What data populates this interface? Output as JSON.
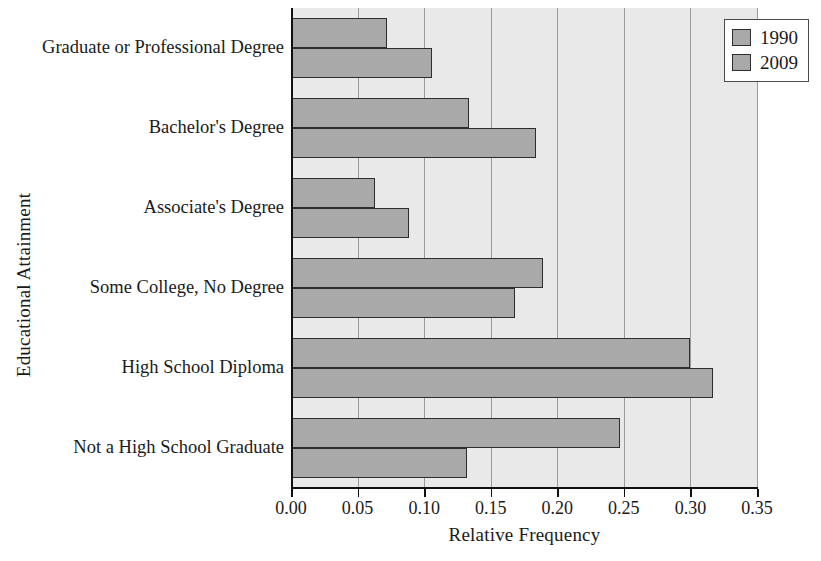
{
  "chart_data": {
    "type": "bar",
    "orientation": "horizontal",
    "title": "",
    "xlabel": "Relative Frequency",
    "ylabel": "Educational Attainment",
    "xlim": [
      0.0,
      0.35
    ],
    "xticks": [
      "0.00",
      "0.05",
      "0.10",
      "0.15",
      "0.20",
      "0.25",
      "0.30",
      "0.35"
    ],
    "xtick_values": [
      0.0,
      0.05,
      0.1,
      0.15,
      0.2,
      0.25,
      0.3,
      0.35
    ],
    "grid": "vertical",
    "legend_position": "top-right",
    "categories": [
      "Graduate or Professional Degree",
      "Bachelor's Degree",
      "Associate's Degree",
      "Some College, No Degree",
      "High School Diploma",
      "Not a High School Graduate"
    ],
    "series": [
      {
        "name": "1990",
        "color": "#a9a9a9",
        "values": [
          0.072,
          0.134,
          0.063,
          0.189,
          0.3,
          0.247
        ]
      },
      {
        "name": "2009",
        "color": "#a9a9a9",
        "values": [
          0.106,
          0.184,
          0.089,
          0.168,
          0.317,
          0.132
        ]
      }
    ]
  },
  "legend": {
    "entries": [
      {
        "label": "1990"
      },
      {
        "label": "2009"
      }
    ]
  },
  "colors": {
    "bar_fill": "#a9a9a9",
    "bar_edge": "#2d2d2d",
    "plot_background": "#e9e9e9",
    "gridline": "#9a9a9a",
    "axis": "#111111",
    "text": "#1a1a1a"
  }
}
